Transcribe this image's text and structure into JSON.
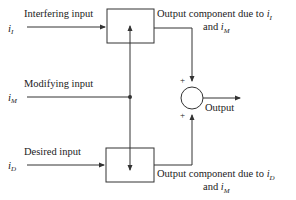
{
  "diagram": {
    "inputs": {
      "interfering": {
        "label": "Interfering input",
        "symbol": "i",
        "subscript": "I"
      },
      "modifying": {
        "label": "Modifying input",
        "symbol": "i",
        "subscript": "M"
      },
      "desired": {
        "label": "Desired input",
        "symbol": "i",
        "subscript": "D"
      }
    },
    "outputs": {
      "top_component": {
        "line1": "Output component due to",
        "var1": "i",
        "sub1": "I",
        "line2_and": "and",
        "var2": "i",
        "sub2": "M"
      },
      "bottom_component": {
        "line1": "Output component due to",
        "var1": "i",
        "sub1": "D",
        "line2_and": "and",
        "var2": "i",
        "sub2": "M"
      },
      "final": {
        "label": "Output"
      }
    },
    "summing_junction": {
      "top_sign": "+",
      "bottom_sign": "+"
    },
    "stroke_color": "#333333"
  }
}
